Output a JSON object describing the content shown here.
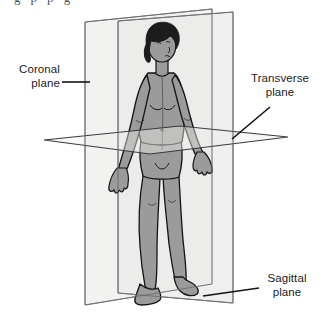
{
  "figure": {
    "type": "anatomical-diagram"
  },
  "labels": [
    {
      "id": "coronal",
      "name": "Coronal plane",
      "line1": "Coronal",
      "line2": "plane",
      "leader": "horizontal",
      "position": "left"
    },
    {
      "id": "transverse",
      "name": "Transverse plane",
      "line1": "Transverse",
      "line2": "plane",
      "leader": "diagonal",
      "position": "upper-right"
    },
    {
      "id": "sagittal",
      "name": "Sagittal plane",
      "line1": "Sagittal",
      "line2": "plane",
      "leader": "diagonal",
      "position": "lower-right"
    }
  ],
  "cropped_header": {
    "text": "g  p                     p      g"
  },
  "colors": {
    "plane_fill_front": "#f2f2f0",
    "plane_fill_side": "#e9e9e7",
    "plane_fill_transverse": "#ededeb",
    "plane_stroke": "#6e6e70",
    "body_fill": "#9b9b9b",
    "body_shade": "#8a8a8a",
    "body_stroke": "#141414",
    "hair": "#1c1c1c",
    "label_text": "#1b1b1b",
    "leader_line": "#141414",
    "background": "#ffffff"
  }
}
